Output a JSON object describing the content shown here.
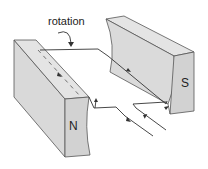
{
  "diagram": {
    "type": "electric motor / generator coil between magnet poles",
    "labels": {
      "rotation": "rotation",
      "north_pole": "N",
      "south_pole": "S"
    },
    "colors": {
      "magnet_fill": "#dcdcdc",
      "magnet_face": "#cfcfcf",
      "outline": "#444444",
      "wire": "#333333",
      "background": "#ffffff"
    }
  }
}
